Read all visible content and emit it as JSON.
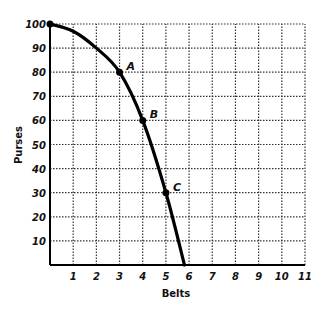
{
  "chart_data": {
    "type": "line",
    "title": "",
    "xlabel": "Belts",
    "ylabel": "Purses",
    "xlim": [
      0,
      11
    ],
    "ylim": [
      0,
      100
    ],
    "x_ticks": [
      1,
      2,
      3,
      4,
      5,
      6,
      7,
      8,
      9,
      10,
      11
    ],
    "y_ticks": [
      10,
      20,
      30,
      40,
      50,
      60,
      70,
      80,
      90,
      100
    ],
    "grid": true,
    "grid_style": "dotted",
    "legend": null,
    "series": [
      {
        "name": "Production possibilities frontier",
        "x": [
          0,
          1,
          2,
          3,
          4,
          5,
          5.8
        ],
        "y": [
          100,
          97,
          90,
          80,
          60,
          30,
          0
        ]
      }
    ],
    "annotations": [
      {
        "label": "A",
        "x": 3,
        "y": 80
      },
      {
        "label": "B",
        "x": 4,
        "y": 60
      },
      {
        "label": "C",
        "x": 5,
        "y": 30
      }
    ],
    "line_color": "#000000",
    "grid_color": "#333333"
  }
}
